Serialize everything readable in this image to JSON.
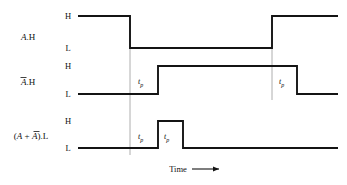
{
  "figure": {
    "type": "timing-diagram",
    "title": "",
    "background_color": "#ffffff",
    "line_color": "#141414",
    "reference_line_color": "#9a9a9a",
    "time_axis": {
      "label": "Time",
      "arrow_icon": "right-arrow-icon"
    },
    "levels": {
      "high_label": "H",
      "low_label": "L"
    },
    "delay_label": {
      "base": "t",
      "subscript": "p",
      "text": "tp"
    },
    "signals": [
      {
        "id": "a-h",
        "name_parts": [
          {
            "text": "A",
            "style": "italic",
            "overbar": false
          },
          {
            "text": ".H",
            "style": "normal",
            "overbar": false
          }
        ],
        "name_text": "A.H",
        "waveform": {
          "start_level": "H",
          "transitions": [
            {
              "time_px": 130,
              "to": "L",
              "edge": "falling"
            },
            {
              "time_px": 272,
              "to": "H",
              "edge": "rising"
            }
          ],
          "end_level": "H"
        },
        "delay_markers": []
      },
      {
        "id": "abar-h",
        "name_parts": [
          {
            "text": "A",
            "style": "italic",
            "overbar": true
          },
          {
            "text": ".H",
            "style": "normal",
            "overbar": false
          }
        ],
        "name_text": "Ā.H",
        "waveform": {
          "start_level": "L",
          "transitions": [
            {
              "time_px": 158,
              "to": "H",
              "edge": "rising"
            },
            {
              "time_px": 297,
              "to": "L",
              "edge": "falling"
            }
          ],
          "end_level": "L"
        },
        "delay_markers": [
          {
            "text": "tp",
            "x_px": 140,
            "from_px": 130,
            "to_px": 158
          },
          {
            "text": "tp",
            "x_px": 280,
            "from_px": 272,
            "to_px": 297
          }
        ]
      },
      {
        "id": "a-plus-abar-l",
        "name_parts": [
          {
            "text": "(",
            "style": "normal",
            "overbar": false
          },
          {
            "text": "A",
            "style": "italic",
            "overbar": false
          },
          {
            "text": " + ",
            "style": "normal",
            "overbar": false
          },
          {
            "text": "A",
            "style": "italic",
            "overbar": true
          },
          {
            "text": ").L",
            "style": "normal",
            "overbar": false
          }
        ],
        "name_text": "(A + Ā).L",
        "waveform": {
          "start_level": "L",
          "transitions": [
            {
              "time_px": 158,
              "to": "H",
              "edge": "rising"
            },
            {
              "time_px": 183,
              "to": "L",
              "edge": "falling"
            }
          ],
          "end_level": "L",
          "note": "static-1 hazard glitch pulse"
        },
        "delay_markers": [
          {
            "text": "tp",
            "x_px": 140,
            "from_px": 130,
            "to_px": 158
          },
          {
            "text": "tp",
            "x_px": 165,
            "from_px": 158,
            "to_px": 183
          }
        ]
      }
    ],
    "reference_lines": [
      {
        "x_px": 130,
        "y_top_px": 16,
        "y_bottom_px": 155
      },
      {
        "x_px": 272,
        "y_px_top": 16,
        "y_bottom_px": 100
      }
    ]
  }
}
